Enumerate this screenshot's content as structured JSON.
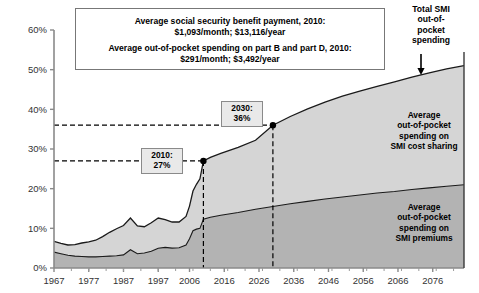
{
  "chart_data": {
    "type": "area",
    "title": "",
    "xlabel": "",
    "ylabel": "",
    "xlim": [
      1967,
      2085
    ],
    "ylim": [
      0,
      60
    ],
    "ytick_labels": [
      "0%",
      "10%",
      "20%",
      "30%",
      "40%",
      "50%",
      "60%"
    ],
    "ytick_values": [
      0,
      10,
      20,
      30,
      40,
      50,
      60
    ],
    "xtick_labels": [
      "1967",
      "1977",
      "1987",
      "1997",
      "2006",
      "2016",
      "2026",
      "2036",
      "2046",
      "2056",
      "2066",
      "2076"
    ],
    "xtick_values": [
      1967,
      1977,
      1987,
      1997,
      2006,
      2016,
      2026,
      2036,
      2046,
      2056,
      2066,
      2076
    ],
    "grid": false,
    "legend_position": "in-plot annotations",
    "stacked": true,
    "x": [
      1967,
      1969,
      1971,
      1973,
      1975,
      1977,
      1979,
      1981,
      1983,
      1985,
      1987,
      1989,
      1991,
      1993,
      1995,
      1997,
      1999,
      2001,
      2003,
      2005,
      2006,
      2007,
      2008,
      2009,
      2010,
      2012,
      2015,
      2020,
      2025,
      2030,
      2035,
      2040,
      2045,
      2050,
      2055,
      2060,
      2065,
      2070,
      2075,
      2080,
      2085
    ],
    "series": [
      {
        "name": "Average out-of-pocket spending on SMI premiums",
        "color": "#b3b3b3",
        "values": [
          4.0,
          3.6,
          3.2,
          3.0,
          2.9,
          2.8,
          2.8,
          2.9,
          3.0,
          3.1,
          3.3,
          4.6,
          3.6,
          3.8,
          4.2,
          5.0,
          5.2,
          5.0,
          5.1,
          5.8,
          7.4,
          9.4,
          9.8,
          10.0,
          12.3,
          12.8,
          13.3,
          14.0,
          14.8,
          15.5,
          16.2,
          16.8,
          17.4,
          17.9,
          18.4,
          18.9,
          19.3,
          19.8,
          20.2,
          20.6,
          21.0
        ]
      },
      {
        "name": "Average out-of-pocket spending on SMI cost sharing",
        "color": "#d5d5d5",
        "values": [
          2.7,
          2.6,
          2.6,
          2.9,
          3.4,
          3.8,
          4.2,
          5.0,
          6.0,
          6.8,
          7.4,
          8.0,
          7.0,
          6.6,
          7.2,
          7.6,
          7.0,
          6.6,
          6.5,
          7.2,
          8.2,
          10.0,
          11.3,
          12.5,
          14.7,
          15.1,
          15.6,
          16.4,
          17.4,
          20.5,
          22.0,
          23.3,
          24.4,
          25.4,
          26.2,
          26.9,
          27.6,
          28.3,
          29.0,
          29.6,
          30.0
        ]
      }
    ],
    "total_name": "Total SMI out-of-pocket spending",
    "total_values": [
      6.7,
      6.2,
      5.8,
      5.9,
      6.3,
      6.6,
      7.0,
      7.9,
      9.0,
      9.9,
      10.7,
      12.6,
      10.6,
      10.4,
      11.4,
      12.6,
      12.2,
      11.6,
      11.6,
      13.0,
      15.6,
      19.4,
      21.1,
      22.5,
      27.0,
      27.9,
      28.9,
      30.4,
      32.2,
      36.0,
      38.2,
      40.1,
      41.8,
      43.3,
      44.6,
      45.8,
      46.9,
      48.1,
      49.2,
      50.2,
      51.0
    ],
    "markers": [
      {
        "label_year": "2010:",
        "label_value": "27%",
        "x": 2010,
        "y": 27
      },
      {
        "label_year": "2030:",
        "label_value": "36%",
        "x": 2030,
        "y": 36
      }
    ],
    "reference_lines": [
      {
        "type": "horizontal",
        "value": 27,
        "style": "dashed"
      },
      {
        "type": "horizontal",
        "value": 36,
        "style": "dashed"
      },
      {
        "type": "vertical",
        "value": 2010,
        "style": "dashed"
      },
      {
        "type": "vertical",
        "value": 2030,
        "style": "dashed"
      }
    ],
    "annotations": {
      "note_box_lines": [
        "Average social security benefit payment, 2010:",
        "$1,093/month; $13,116/year",
        "Average out-of-pocket spending on part B and part D, 2010:",
        "$291/month; $3,492/year"
      ],
      "top_right_label": [
        "Total SMI",
        "out-of-",
        "pocket",
        "spending"
      ],
      "band_upper_label": [
        "Average",
        "out-of-pocket",
        "spending on",
        "SMI cost sharing"
      ],
      "band_lower_label": [
        "Average",
        "out-of-pocket",
        "spending on",
        "SMI premiums"
      ]
    }
  }
}
